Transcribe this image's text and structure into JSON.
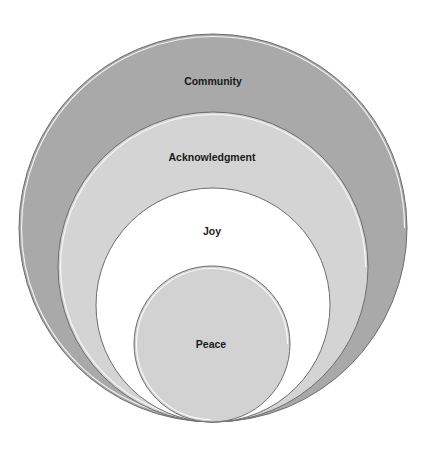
{
  "diagram": {
    "type": "nested-circles",
    "circles": [
      {
        "label": "Community",
        "fill": "#a9a9a9"
      },
      {
        "label": "Acknowledgment",
        "fill": "#d4d4d4"
      },
      {
        "label": "Joy",
        "fill": "#ffffff"
      },
      {
        "label": "Peace",
        "fill": "#d2d2d2"
      }
    ]
  }
}
